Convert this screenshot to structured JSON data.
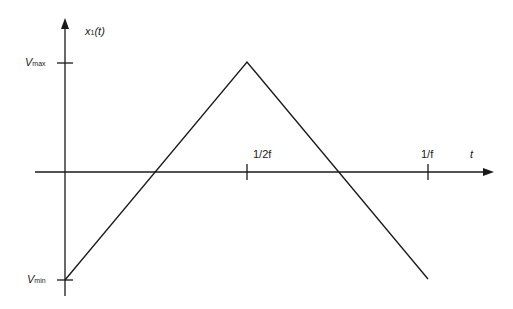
{
  "diagram": {
    "y_axis_label": {
      "main": "x",
      "sub": "1",
      "arg": "(t)"
    },
    "x_axis_label": "t",
    "y_ticks": [
      {
        "name": "V",
        "sub": "max"
      },
      {
        "name": "V",
        "sub": "min"
      }
    ],
    "x_ticks": [
      "1/2f",
      "1/f"
    ],
    "waveform": {
      "type": "triangle",
      "points": [
        {
          "t": "0",
          "value": "Vmin"
        },
        {
          "t": "1/2f",
          "value": "Vmax"
        },
        {
          "t": "1/f",
          "value": "Vmin"
        }
      ]
    },
    "line_color": "#1a1a1a"
  }
}
